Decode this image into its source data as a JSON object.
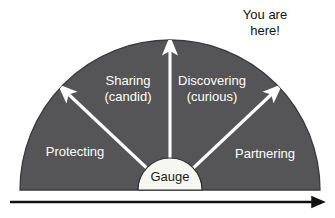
{
  "figure": {
    "colors": {
      "arc_fill": "#555557",
      "arc_stroke": "#3a3a3c",
      "gauge_fill": "#f7f7f2",
      "gauge_stroke": "#2f2f2f",
      "arrow_white": "#ffffff",
      "axis_black": "#111111",
      "background": "#ffffff",
      "label_light": "#ffffff",
      "label_dark": "#1b1b1b"
    },
    "zones": [
      {
        "id": "protecting",
        "label": "Protecting",
        "sublabel": "",
        "x": 75,
        "y": 153
      },
      {
        "id": "sharing",
        "label": "Sharing",
        "sublabel": "(candid)",
        "x": 128,
        "y": 88
      },
      {
        "id": "discovering",
        "label": "Discovering",
        "sublabel": "(curious)",
        "x": 212,
        "y": 88
      },
      {
        "id": "partnering",
        "label": "Partnering",
        "sublabel": "",
        "x": 265,
        "y": 155
      }
    ],
    "gauge": {
      "label": "Gauge",
      "cx": 170,
      "cy": 190,
      "r": 32
    },
    "callout": {
      "line1": "You are",
      "line2": "here!",
      "x": 265,
      "y": 15
    },
    "needles": [
      {
        "id": "needle-protecting-sharing",
        "angle_deg": 135,
        "label": "left diagonal needle"
      },
      {
        "id": "needle-vertical",
        "angle_deg": 90,
        "label": "vertical needle"
      },
      {
        "id": "needle-discovering-partnering",
        "angle_deg": 45,
        "label": "right diagonal needle"
      }
    ],
    "baseline_axis": {
      "id": "progress-axis",
      "label": "",
      "x_start": 10,
      "x_end": 325,
      "y": 202,
      "direction": "right"
    }
  }
}
